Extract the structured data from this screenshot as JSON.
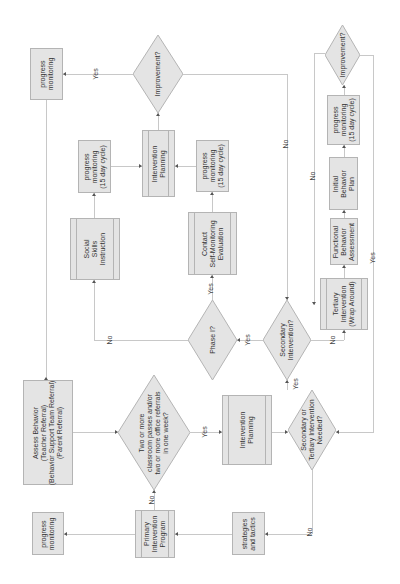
{
  "diagram": {
    "orientation": "rotated-90-ccw",
    "colors": {
      "node_fill": "#e4e4e4",
      "node_border": "#b4b4b4",
      "connector": "#c8c8c8",
      "text": "#333333"
    },
    "nodes": {
      "assess_behavior": "Assess Behavior\n(Teacher Referral)\n(Behavior Support Team Referral)\n(Parent Referral)",
      "two_or_more": "Two or more\nclassroom passes and/or\ntwo or more office referrals\nin one week?",
      "primary_program": "Primary\nIntervention\nProgram",
      "pm_bottom": "progress\nmonitoring",
      "strategies": "strategies\nand tactics",
      "intervention_planning_lower": "Intervention\nPlanning",
      "sec_or_tert": "Secondary or\nTertiary Intervention\nNeeded?",
      "secondary_intervention": "Secondary\nIntervention?",
      "phase1": "Phase I?",
      "social_skills": "Social\nSkills\nInstruction",
      "contact_self_monitoring": "Contact\nSelf-Monitoring\nEvaluation",
      "pm15_left": "progress\nmonitoring\n(15 day cycle)",
      "pm15_mid": "progress\nmonitoring\n(15 day cycle)",
      "intervention_planning_upper": "Intervention\nPlanning",
      "improvement_top": "Improvement?",
      "pm_top": "progress\nmonitoring",
      "tertiary": "Tertiary\nIntervention\n(Wrap Around)",
      "fba": "Functional\nBehavior\nAssessment",
      "initial_plan": "Initial\nBehavior\nPlan",
      "pm15_right": "progress\nmonitoring\n(15 day cycle)",
      "improvement_right": "Improvement?"
    },
    "edge_labels": {
      "two_no": "No",
      "two_yes": "Yes",
      "sec_tert_no": "No",
      "sec_tert_yes": "Yes",
      "secondary_yes": "Yes",
      "secondary_no": "No",
      "phase1_no": "No",
      "phase1_yes": "Yes",
      "improvement_top_yes": "Yes",
      "improvement_top_no": "No",
      "improvement_right_no": "No",
      "improvement_right_yes": "Yes"
    }
  }
}
